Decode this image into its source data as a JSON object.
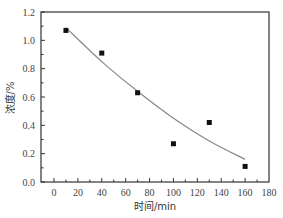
{
  "chart_data": {
    "type": "scatter",
    "title": "",
    "xlabel": "时间/min",
    "ylabel": "浓度/%",
    "xlim": [
      -11,
      180
    ],
    "ylim": [
      0.0,
      1.2
    ],
    "x_ticks": [
      0,
      20,
      40,
      60,
      80,
      100,
      120,
      140,
      160,
      180
    ],
    "y_ticks": [
      0.0,
      0.2,
      0.4,
      0.6,
      0.8,
      1.0,
      1.2
    ],
    "x_tick_labels": [
      "0",
      "20",
      "40",
      "60",
      "80",
      "100",
      "120",
      "140",
      "160",
      "180"
    ],
    "y_tick_labels": [
      "0.0",
      "0.2",
      "0.4",
      "0.6",
      "0.8",
      "1.0",
      "1.2"
    ],
    "grid": false,
    "legend": null,
    "series": [
      {
        "name": "measured",
        "style": "square-markers",
        "x": [
          10,
          40,
          70,
          100,
          130,
          160
        ],
        "y": [
          1.07,
          0.91,
          0.63,
          0.27,
          0.42,
          0.11
        ]
      },
      {
        "name": "fit",
        "style": "line",
        "x": [
          10,
          40,
          70,
          100,
          130,
          160
        ],
        "y": [
          1.09,
          0.85,
          0.64,
          0.45,
          0.29,
          0.16
        ]
      }
    ],
    "colors": {
      "markers": "#111111",
      "fit_line": "#888888",
      "axes": "#333333"
    }
  }
}
